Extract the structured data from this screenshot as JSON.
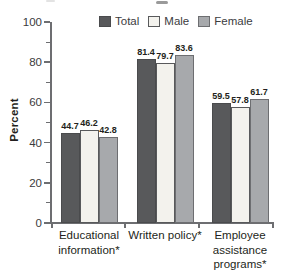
{
  "chart_data": {
    "type": "bar",
    "title": "",
    "ylabel": "Percent",
    "xlabel": "",
    "ylim": [
      0,
      100
    ],
    "yticks": [
      0,
      20,
      40,
      60,
      80,
      100
    ],
    "minor_yticks": [
      10,
      30,
      50,
      70,
      90
    ],
    "grid": false,
    "legend_position": "top",
    "categories": [
      "Educational information*",
      "Written policy*",
      "Employee assistance programs*"
    ],
    "category_lines": [
      [
        "Educational",
        "information*"
      ],
      [
        "Written policy*"
      ],
      [
        "Employee",
        "assistance",
        "programs*"
      ]
    ],
    "series": [
      {
        "name": "Total",
        "values": [
          44.7,
          81.4,
          59.5
        ],
        "color": "#58595b",
        "border": "#4a4b4d"
      },
      {
        "name": "Male",
        "values": [
          46.2,
          79.7,
          57.8
        ],
        "color": "#f3f2ed",
        "border": "#58595b"
      },
      {
        "name": "Female",
        "values": [
          42.8,
          83.6,
          61.7
        ],
        "color": "#a7a9ac",
        "border": "#6d6e71"
      }
    ],
    "value_labels": {
      "Educational information*": {
        "Total": 44.7,
        "Male": 46.2,
        "Female": 42.8
      },
      "Written policy*": {
        "Total": 81.4,
        "Male": 79.7,
        "Female": 83.6
      },
      "Employee assistance programs*": {
        "Total": 59.5,
        "Male": 57.8,
        "Female": 61.7
      }
    },
    "colors": {
      "axis": "#6d6e71",
      "text": "#231f20",
      "tick_label": "#3a3a3c"
    }
  }
}
